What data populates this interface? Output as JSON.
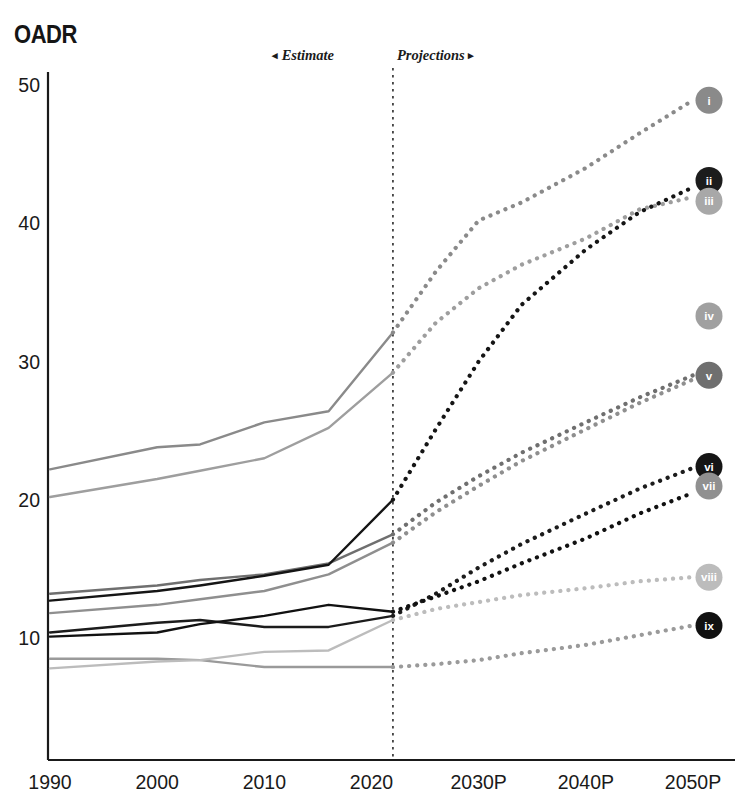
{
  "chart_data": {
    "type": "line",
    "title": "OADR",
    "xlabel": "",
    "ylabel": "OADR",
    "x": [
      1990,
      2000,
      2010,
      2020,
      2030,
      2040,
      2050
    ],
    "tick_labels": [
      "1990",
      "2000",
      "2010",
      "2020",
      "2030P",
      "2040P",
      "2050P"
    ],
    "y_ticks": [
      10,
      20,
      30,
      40,
      50
    ],
    "ylim": [
      5,
      51
    ],
    "xlim": [
      1990,
      2050
    ],
    "grid": false,
    "legend_position": "right-inline-markers",
    "estimate_label": "Estimate",
    "projections_label": "Projections",
    "estimate_arrow": "◂",
    "projections_arrow": "▸",
    "split_year": 2022,
    "annotations": [
      {
        "text": "Estimate",
        "position": "left-of-divider"
      },
      {
        "text": "Projections",
        "position": "right-of-divider"
      }
    ],
    "series": [
      {
        "name": "i",
        "marker_label": "i",
        "color": "#8a8a8a",
        "history": {
          "x": [
            1990,
            2000,
            2004,
            2010,
            2016,
            2022
          ],
          "y": [
            22.2,
            23.8,
            24.0,
            25.6,
            26.4,
            32.1
          ]
        },
        "projection": {
          "x": [
            2022,
            2026,
            2030,
            2034,
            2040,
            2045,
            2050
          ],
          "y": [
            32.1,
            36.5,
            40.2,
            41.5,
            44.0,
            46.5,
            48.9
          ]
        },
        "end_value": 48.9
      },
      {
        "name": "ii",
        "marker_label": "ii",
        "color": "#1c1c1c",
        "history": {
          "x": [
            1990,
            2000,
            2004,
            2010,
            2016,
            2022
          ],
          "y": [
            10.4,
            11.1,
            11.3,
            10.8,
            10.8,
            11.6
          ]
        },
        "projection": {
          "x": [
            2022,
            2026,
            2030,
            2034,
            2040,
            2045,
            2050
          ],
          "y": [
            11.6,
            13.2,
            15.1,
            16.8,
            19.0,
            20.8,
            22.3
          ]
        },
        "end_value": 22.3
      },
      {
        "name": "iii",
        "marker_label": "iii",
        "color": "#9e9e9e",
        "history": {
          "x": [
            1990,
            2000,
            2004,
            2010,
            2016,
            2022
          ],
          "y": [
            20.2,
            21.5,
            22.1,
            23.0,
            25.2,
            29.2
          ]
        },
        "projection": {
          "x": [
            2022,
            2026,
            2030,
            2034,
            2040,
            2045,
            2050
          ],
          "y": [
            29.2,
            32.8,
            35.3,
            37.0,
            38.9,
            41.0,
            41.9
          ]
        },
        "end_value": 41.9
      },
      {
        "name": "iv",
        "marker_label": "iv",
        "color": "#9a9a9a",
        "history": {
          "x": [
            1990,
            2000,
            2004,
            2010,
            2016,
            2022
          ],
          "y": [
            8.5,
            8.5,
            8.4,
            7.9,
            7.9,
            7.9
          ]
        },
        "projection": {
          "x": [
            2022,
            2026,
            2030,
            2034,
            2040,
            2045,
            2050
          ],
          "y": [
            7.9,
            8.1,
            8.4,
            8.9,
            9.5,
            10.2,
            10.9
          ]
        },
        "end_value": 10.9
      },
      {
        "name": "v",
        "marker_label": "v",
        "color": "#6f6f6f",
        "history": {
          "x": [
            1990,
            2000,
            2004,
            2010,
            2016,
            2022
          ],
          "y": [
            13.2,
            13.8,
            14.2,
            14.6,
            15.4,
            17.5
          ]
        },
        "projection": {
          "x": [
            2022,
            2026,
            2030,
            2034,
            2040,
            2045,
            2050
          ],
          "y": [
            17.5,
            19.8,
            21.7,
            23.4,
            25.6,
            27.4,
            29.0
          ]
        },
        "end_value": 29.0
      },
      {
        "name": "vi",
        "marker_label": "vi",
        "color": "#151515",
        "history": {
          "x": [
            1990,
            2000,
            2004,
            2010,
            2016,
            2022
          ],
          "y": [
            12.7,
            13.4,
            13.8,
            14.5,
            15.3,
            20.0
          ]
        },
        "projection": {
          "x": [
            2022,
            2026,
            2030,
            2034,
            2040,
            2045,
            2050
          ],
          "y": [
            20.0,
            25.1,
            30.0,
            34.1,
            38.1,
            40.8,
            42.6
          ]
        },
        "end_value": 42.6
      },
      {
        "name": "vii",
        "marker_label": "vii",
        "color": "#8f8f8f",
        "history": {
          "x": [
            1990,
            2000,
            2004,
            2010,
            2016,
            2022
          ],
          "y": [
            11.8,
            12.4,
            12.8,
            13.4,
            14.6,
            16.9
          ]
        },
        "projection": {
          "x": [
            2022,
            2026,
            2030,
            2034,
            2040,
            2045,
            2050
          ],
          "y": [
            16.9,
            19.1,
            21.0,
            22.8,
            25.1,
            27.0,
            28.7
          ]
        },
        "end_value": 28.7
      },
      {
        "name": "viii",
        "marker_label": "viii",
        "color": "#bcbcbc",
        "history": {
          "x": [
            1990,
            2000,
            2004,
            2010,
            2016,
            2022
          ],
          "y": [
            7.8,
            8.3,
            8.4,
            9.0,
            9.1,
            11.3
          ]
        },
        "projection": {
          "x": [
            2022,
            2026,
            2030,
            2034,
            2040,
            2045,
            2050
          ],
          "y": [
            11.3,
            12.1,
            12.6,
            13.1,
            13.6,
            14.1,
            14.4
          ]
        },
        "end_value": 14.4
      },
      {
        "name": "ix",
        "marker_label": "ix",
        "color": "#111111",
        "history": {
          "x": [
            1990,
            2000,
            2004,
            2010,
            2016,
            2022
          ],
          "y": [
            10.1,
            10.4,
            11.0,
            11.6,
            12.4,
            11.9
          ]
        },
        "projection": {
          "x": [
            2022,
            2026,
            2030,
            2034,
            2040,
            2045,
            2050
          ],
          "y": [
            11.9,
            13.0,
            14.1,
            15.4,
            17.2,
            19.0,
            20.5
          ]
        },
        "end_value": 20.5
      }
    ],
    "markers": [
      {
        "label": "i",
        "y": 48.9,
        "fill": "#8a8a8a"
      },
      {
        "label": "ii",
        "y": 43.1,
        "fill": "#1c1c1c"
      },
      {
        "label": "iii",
        "y": 41.6,
        "fill": "#a8a8a8"
      },
      {
        "label": "iv",
        "y": 33.3,
        "fill": "#a0a0a0"
      },
      {
        "label": "v",
        "y": 29.0,
        "fill": "#6f6f6f"
      },
      {
        "label": "vi",
        "y": 22.4,
        "fill": "#151515"
      },
      {
        "label": "vii",
        "y": 21.0,
        "fill": "#909090"
      },
      {
        "label": "viii",
        "y": 14.4,
        "fill": "#bcbcbc"
      },
      {
        "label": "ix",
        "y": 10.9,
        "fill": "#111111"
      }
    ]
  },
  "colors": {
    "axis": "#1a1a1a",
    "divider": "#2a2a2a",
    "background": "#ffffff",
    "text": "#1a1a1a"
  }
}
